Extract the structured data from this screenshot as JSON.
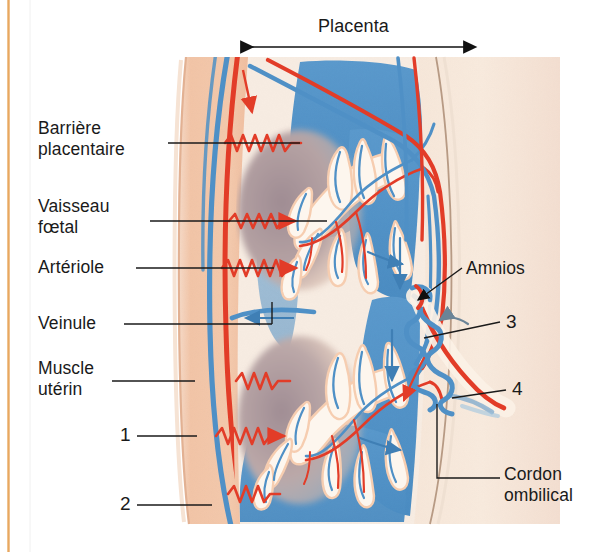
{
  "figure": {
    "kind": "anatomical-diagram",
    "language": "fr",
    "frame": {
      "rule_color": "#e8a860"
    }
  },
  "title": {
    "text": "Placenta",
    "span_arrow": "double-headed"
  },
  "labels_left": [
    {
      "id": "barriere-placentaire",
      "text": "Barrière\nplacentaire",
      "x": 38,
      "y": 118,
      "leader_y": 143,
      "leader_x1": 168,
      "leader_x2": 300
    },
    {
      "id": "vaisseau-foetal",
      "text": "Vaisseau\nfœtal",
      "x": 38,
      "y": 196,
      "leader_y": 221,
      "leader_x1": 150,
      "leader_x2": 327
    },
    {
      "id": "arteriole",
      "text": "Artériole",
      "x": 38,
      "y": 257,
      "leader_y": 268,
      "leader_x1": 136,
      "leader_x2": 274
    },
    {
      "id": "veinule",
      "text": "Veinule",
      "x": 38,
      "y": 313,
      "leader_y": 324,
      "leader_x1": 124,
      "leader_x2": 272
    },
    {
      "id": "muscle-uterin",
      "text": "Muscle\nutérin",
      "x": 38,
      "y": 358,
      "leader_y": 381,
      "leader_x1": 112,
      "leader_x2": 195
    },
    {
      "id": "repere-1",
      "text": "1",
      "x": 120,
      "y": 425,
      "leader_y": 436,
      "leader_x1": 137,
      "leader_x2": 197
    },
    {
      "id": "repere-2",
      "text": "2",
      "x": 120,
      "y": 494,
      "leader_y": 505,
      "leader_x1": 137,
      "leader_x2": 212
    }
  ],
  "labels_right": [
    {
      "id": "amnios",
      "text": "Amnios",
      "x": 466,
      "y": 262
    },
    {
      "id": "repere-3",
      "text": "3",
      "x": 506,
      "y": 316
    },
    {
      "id": "repere-4",
      "text": "4",
      "x": 512,
      "y": 381
    },
    {
      "id": "cordon-ombilical",
      "text": "Cordon\nombilical",
      "x": 506,
      "y": 465
    }
  ],
  "colors": {
    "uterine_muscle": "#f2c4a6",
    "uterine_muscle_edge": "#e8b395",
    "amnion_field": "#f7e8dc",
    "intervillous_blood": "#4f90c6",
    "intervillous_blood_dark": "#3f7fb5",
    "decidua_shadow": "#a9949a",
    "artery_red": "#e23c28",
    "vein_blue": "#4f90c6",
    "villus_fill": "#fdf6ee",
    "leader_line": "#1a1a1a",
    "text": "#1a1a1a"
  },
  "flow_arrows": [
    {
      "id": "maternal-artery-in",
      "color": "#e23c28",
      "note": "down, top-left"
    },
    {
      "id": "maternal-vein-out",
      "color": "#3f7fb5",
      "note": "left, mid-left"
    },
    {
      "id": "fetal-vein-down",
      "color": "#3f7fb5",
      "note": "down, right"
    },
    {
      "id": "umbilical-vein-up",
      "color": "#5f7f9c",
      "note": "up-left, cord"
    },
    {
      "id": "umbilical-artery-down",
      "color": "#e23c28",
      "note": "down-right, cord"
    }
  ]
}
